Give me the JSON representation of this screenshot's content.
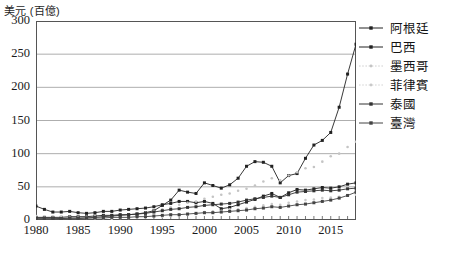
{
  "chart_data": {
    "type": "line",
    "title": "",
    "ylabel": "美元 (百億)",
    "xlabel": "",
    "xlim": [
      1980,
      2018
    ],
    "ylim": [
      0,
      300
    ],
    "yticks": [
      0,
      50,
      100,
      150,
      200,
      250,
      300
    ],
    "xticks": [
      1980,
      1985,
      1990,
      1995,
      2000,
      2005,
      2010,
      2015
    ],
    "grid": true,
    "legend_position": "right",
    "x": [
      1980,
      1981,
      1982,
      1983,
      1984,
      1985,
      1986,
      1987,
      1988,
      1989,
      1990,
      1991,
      1992,
      1993,
      1994,
      1995,
      1996,
      1997,
      1998,
      1999,
      2000,
      2001,
      2002,
      2003,
      2004,
      2005,
      2006,
      2007,
      2008,
      2009,
      2010,
      2011,
      2012,
      2013,
      2014,
      2015,
      2016,
      2017,
      2018
    ],
    "series": [
      {
        "name": "阿根廷",
        "color": "#222222",
        "style": "solid",
        "marker": "square",
        "values": [
          21,
          16,
          12,
          12,
          13,
          11,
          10,
          11,
          13,
          13,
          15,
          16,
          17,
          18,
          20,
          23,
          25,
          28,
          28,
          26,
          28,
          25,
          17,
          19,
          23,
          27,
          31,
          36,
          40,
          34,
          41,
          46,
          45,
          47,
          49,
          48,
          50,
          54,
          56
        ]
      },
      {
        "name": "巴西",
        "color": "#222222",
        "style": "solid",
        "marker": "square",
        "values": [
          4,
          4,
          4,
          4,
          5,
          5,
          5,
          6,
          7,
          7,
          8,
          8,
          9,
          11,
          14,
          22,
          30,
          45,
          42,
          40,
          56,
          52,
          48,
          53,
          63,
          81,
          88,
          87,
          81,
          56,
          67,
          70,
          93,
          113,
          120,
          132,
          170,
          220,
          265
        ]
      },
      {
        "name": "墨西哥",
        "color": "#c4c4c4",
        "style": "dotted",
        "marker": "dot",
        "values": [
          6,
          5,
          5,
          5,
          5,
          5,
          5,
          6,
          6,
          6,
          7,
          8,
          9,
          11,
          14,
          16,
          19,
          23,
          26,
          28,
          32,
          35,
          38,
          40,
          44,
          47,
          52,
          58,
          63,
          60,
          67,
          72,
          78,
          80,
          88,
          96,
          100,
          110,
          118
        ]
      },
      {
        "name": "菲律賓",
        "color": "#c9c9c9",
        "style": "dotted",
        "marker": "dot",
        "values": [
          2,
          2,
          2,
          2,
          2,
          2,
          2,
          2,
          2,
          2,
          3,
          3,
          4,
          4,
          5,
          5,
          6,
          7,
          8,
          9,
          12,
          13,
          14,
          16,
          16,
          18,
          20,
          22,
          24,
          23,
          26,
          28,
          30,
          31,
          33,
          34,
          35,
          37,
          38
        ]
      },
      {
        "name": "泰國",
        "color": "#333333",
        "style": "solid",
        "marker": "square",
        "values": [
          3,
          3,
          3,
          2,
          3,
          3,
          3,
          4,
          5,
          6,
          7,
          8,
          9,
          10,
          12,
          14,
          16,
          17,
          19,
          20,
          22,
          23,
          24,
          25,
          27,
          30,
          32,
          34,
          36,
          34,
          38,
          42,
          43,
          44,
          45,
          44,
          45,
          47,
          48
        ]
      },
      {
        "name": "臺灣",
        "color": "#444444",
        "style": "solid",
        "marker": "square",
        "values": [
          2,
          2,
          2,
          2,
          2,
          2,
          3,
          3,
          3,
          4,
          4,
          4,
          5,
          5,
          6,
          7,
          8,
          8,
          9,
          10,
          11,
          11,
          12,
          13,
          14,
          15,
          17,
          18,
          20,
          19,
          21,
          23,
          24,
          26,
          28,
          30,
          33,
          37,
          42
        ]
      }
    ]
  },
  "axis": {
    "ylabel_text": "美元 (百億)",
    "ytick_labels": [
      "300",
      "250",
      "200",
      "150",
      "100",
      "50",
      "0"
    ],
    "xtick_labels": [
      "1980",
      "1985",
      "1990",
      "1995",
      "2000",
      "2005",
      "2010",
      "2015"
    ]
  },
  "legend": {
    "items": [
      {
        "label": "阿根廷",
        "color": "#222222",
        "style": "solid"
      },
      {
        "label": "巴西",
        "color": "#222222",
        "style": "solid"
      },
      {
        "label": "墨西哥",
        "color": "#c4c4c4",
        "style": "dotted"
      },
      {
        "label": "菲律賓",
        "color": "#c9c9c9",
        "style": "dotted"
      },
      {
        "label": "泰國",
        "color": "#333333",
        "style": "solid"
      },
      {
        "label": "臺灣",
        "color": "#444444",
        "style": "solid"
      }
    ]
  }
}
